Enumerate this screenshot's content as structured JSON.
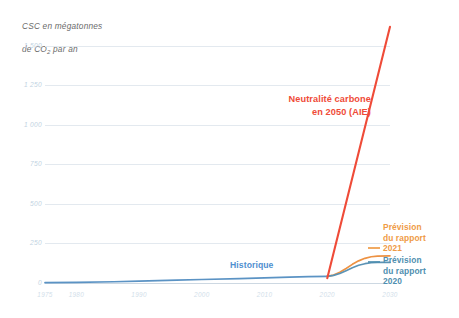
{
  "chart_data": {
    "type": "line",
    "title": "CSC en mégatonnes de CO2 par an",
    "ylabel": "CSC en mégatonnes de CO2 par an",
    "xlabel": "",
    "grid": true,
    "legend_position": "right-inline",
    "xlim": [
      1975,
      2030
    ],
    "ylim": [
      0,
      1600
    ],
    "yticks": [
      0,
      250,
      500,
      750,
      1000,
      1250,
      1500
    ],
    "ytick_labels": [
      "0",
      "250",
      "500",
      "750",
      "1 000",
      "1 250",
      "1 500"
    ],
    "xticks": [
      1975,
      1980,
      1990,
      2000,
      2010,
      2020,
      2030
    ],
    "xtick_labels": [
      "1975",
      "1980",
      "1990",
      "2000",
      "2010",
      "2020",
      "2030"
    ],
    "series": [
      {
        "name": "Historique",
        "color": "#5b93c4",
        "x": [
          1975,
          1980,
          1986,
          1990,
          1996,
          2000,
          2006,
          2010,
          2014,
          2017,
          2020
        ],
        "values": [
          2,
          4,
          8,
          12,
          18,
          22,
          28,
          33,
          37,
          40,
          42
        ]
      },
      {
        "name": "Prévision du rapport 2021",
        "color": "#ed9243",
        "x": [
          2020,
          2021,
          2022,
          2023,
          2024,
          2025,
          2026,
          2027,
          2028,
          2030
        ],
        "values": [
          42,
          50,
          68,
          92,
          118,
          140,
          156,
          166,
          170,
          172
        ]
      },
      {
        "name": "Prévision du rapport 2020",
        "color": "#5b93b5",
        "x": [
          2020,
          2021,
          2022,
          2023,
          2024,
          2025,
          2026,
          2027,
          2028,
          2030
        ],
        "values": [
          42,
          48,
          60,
          78,
          96,
          112,
          122,
          128,
          130,
          130
        ]
      },
      {
        "name": "Neutralité carbone en 2050 (AIE)",
        "color": "#ef4b38",
        "x": [
          2020,
          2030
        ],
        "values": [
          30,
          1620
        ]
      }
    ],
    "annotations": [
      {
        "text": "Neutralité carbone\nen 2050 (AIE)",
        "color": "#ef4b38"
      },
      {
        "text": "Historique",
        "color": "#4f8fd0"
      }
    ],
    "legend": [
      {
        "label": "Prévision\ndu rapport\n2021",
        "color": "#ef9b46"
      },
      {
        "label": "Prévision\ndu rapport\n2020",
        "color": "#4f8fb0"
      }
    ]
  },
  "labels": {
    "axis_title_line1": "CSC en mégatonnes",
    "axis_title_line2_pre": "de CO",
    "axis_title_sub": "2",
    "axis_title_line2_post": " par an",
    "annotation_red": "Neutralité carbone\nen 2050 (AIE)",
    "annotation_historique": "Historique",
    "legend_2021": "Prévision\ndu rapport\n2021",
    "legend_2020": "Prévision\ndu rapport\n2020"
  }
}
